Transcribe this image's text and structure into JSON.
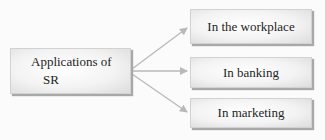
{
  "diagram": {
    "center": {
      "line1": "Applications of",
      "line2": "SR"
    },
    "branches": [
      {
        "label": "In the workplace"
      },
      {
        "label": "In banking"
      },
      {
        "label": "In marketing"
      }
    ],
    "colors": {
      "arrow": "#b9b9b9",
      "box_border": "#d2d2d2",
      "text": "#1e1e1e"
    }
  }
}
